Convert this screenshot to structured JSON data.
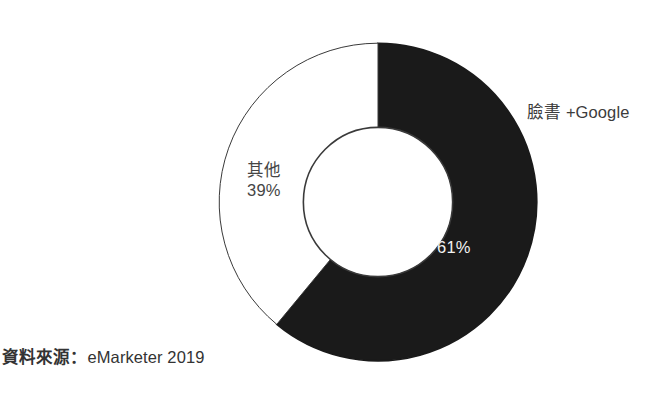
{
  "figure": {
    "background_color": "#ffffff",
    "top_edge_fragment": "上"
  },
  "source_note": {
    "label": "資料來源：",
    "value": "eMarketer 2019",
    "full_text": "資料來源：eMarketer 2019"
  },
  "chart_data": {
    "type": "pie",
    "variant": "donut",
    "title": "",
    "subtitle": "",
    "xlabel": "",
    "ylabel": "",
    "grid": false,
    "legend_position": "none",
    "units": "percent",
    "start_angle_deg": 0,
    "direction": "clockwise",
    "inner_radius_ratio": 0.47,
    "categories": [
      "臉書 +Google",
      "其他"
    ],
    "values": [
      61,
      39
    ],
    "labels": [
      "61%",
      "39%"
    ],
    "colors": [
      "#1a1a1a",
      "#ffffff"
    ],
    "slices": [
      {
        "name": "臉書 +Google",
        "value": 61,
        "value_label": "61%",
        "color": "#1a1a1a",
        "stroke": "#1a1a1a",
        "label_color": "#f2f2f2",
        "label_placement": "inside",
        "callout": "臉書 +Google"
      },
      {
        "name": "其他",
        "value": 39,
        "value_label": "39%",
        "color": "#ffffff",
        "stroke": "#3a3a3a",
        "label_color": "#454545",
        "label_placement": "outside-left",
        "callout": "其他"
      }
    ],
    "annotations": [
      {
        "text": "臉書 +Google",
        "position": "right"
      },
      {
        "text": "其他",
        "position": "left"
      },
      {
        "text": "39%",
        "position": "left"
      },
      {
        "text": "61%",
        "position": "inside-right-lower"
      }
    ]
  }
}
